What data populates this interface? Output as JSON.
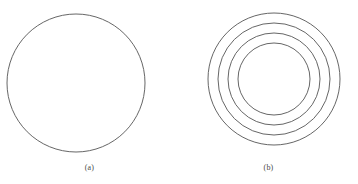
{
  "figure": {
    "background_color": "#ffffff",
    "stroke_color": "#555555",
    "stroke_width": 0.9,
    "width": 358,
    "height": 184
  },
  "panels": [
    {
      "id": "a",
      "caption": "(a)",
      "description": "single-circle",
      "center_x": 76,
      "center_y": 83,
      "circle_count": 1,
      "radii": [
        69
      ]
    },
    {
      "id": "b",
      "caption": "(b)",
      "description": "concentric-circles",
      "center_x": 95,
      "center_y": 79,
      "circle_count": 4,
      "radii": [
        66,
        56,
        46,
        36
      ]
    }
  ],
  "chart_data": {
    "type": "scatter",
    "title": "",
    "subtitle": "",
    "xlabel": "",
    "ylabel": "",
    "grid": false,
    "legend": "none",
    "series": [
      {
        "name": "(a)",
        "shape": "circle",
        "center": [
          76,
          83
        ],
        "values": [
          69
        ]
      },
      {
        "name": "(b)",
        "shape": "concentric-circles",
        "center": [
          274,
          79
        ],
        "values": [
          66,
          56,
          46,
          36
        ]
      }
    ],
    "annotations": [
      "(a)",
      "(b)"
    ]
  }
}
